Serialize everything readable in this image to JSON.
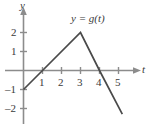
{
  "chart_data": {
    "type": "line",
    "title": "",
    "curve_label": "y = g(t)",
    "xlabel": "t",
    "ylabel": "y",
    "xlim": [
      -0.35,
      6.1
    ],
    "ylim": [
      -2.55,
      2.75
    ],
    "grid": false,
    "legend": "none",
    "xticks": [
      1,
      2,
      3,
      4,
      5
    ],
    "xtick_labels": [
      "1",
      "2",
      "3",
      "4",
      "5"
    ],
    "yticks": [
      2,
      1,
      -1,
      -2
    ],
    "ytick_labels": [
      "2",
      "1",
      "–1",
      "–2"
    ],
    "series": [
      {
        "name": "g",
        "x": [
          0,
          1,
          3,
          4,
          5.2
        ],
        "y": [
          -1,
          0,
          2,
          0,
          -2.3
        ],
        "breakpoints": [
          {
            "t": 0,
            "g": -1
          },
          {
            "t": 1,
            "g": 0
          },
          {
            "t": 3,
            "g": 2
          },
          {
            "t": 4,
            "g": 0
          },
          {
            "t": 5.2,
            "g": -2.3
          }
        ]
      }
    ],
    "colors": {
      "curve": "#4a4a4a",
      "axis": "#8c8c8c",
      "text": "#3a3a3a",
      "background": "#ffffff"
    }
  },
  "figure": {
    "axis_label_y": "y",
    "axis_label_t": "t",
    "curve_label": "y = g(t)",
    "tick_2": "2",
    "tick_1": "1",
    "tick_neg1": "–1",
    "tick_neg2": "–2",
    "tick_x1": "1",
    "tick_x2": "2",
    "tick_x3": "3",
    "tick_x4": "4",
    "tick_x5": "5"
  }
}
